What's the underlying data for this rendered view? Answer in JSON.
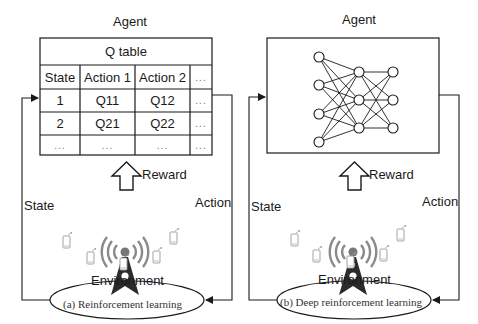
{
  "panel_a": {
    "agent_label": "Agent",
    "table": {
      "title": "Q table",
      "headers": [
        "State",
        "Action 1",
        "Action 2",
        "..."
      ],
      "rows": [
        [
          "1",
          "Q11",
          "Q12",
          "..."
        ],
        [
          "2",
          "Q21",
          "Q22",
          "..."
        ],
        [
          "...",
          "...",
          "...",
          "..."
        ]
      ]
    },
    "reward_label": "Reward",
    "state_label": "State",
    "action_label": "Action",
    "environment_label": "Environment",
    "caption": "(a)  Reinforcement learning"
  },
  "panel_b": {
    "agent_label": "Agent",
    "network": {
      "layers": [
        4,
        3,
        3
      ]
    },
    "reward_label": "Reward",
    "state_label": "State",
    "action_label": "Action",
    "environment_label": "Environment",
    "caption": "(b)  Deep reinforcement learning"
  },
  "icons": {
    "tower": "cell-tower-icon",
    "device": "mobile-device-icon"
  },
  "colors": {
    "line": "#1a1a1a",
    "tower": "#2b2b2b",
    "signal": "#888888",
    "device": "#999999"
  }
}
